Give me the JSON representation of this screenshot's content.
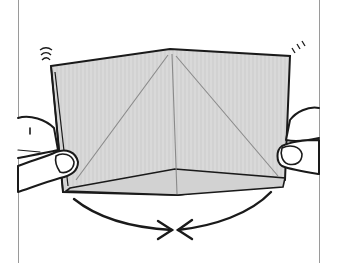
{
  "illustration": {
    "subject": "origami-fold-step",
    "colors": {
      "paper": "#d9d9d9",
      "paper_texture": "#c4c4c4",
      "outline": "#1a1a1a",
      "crease": "#8a8a8a",
      "frame": "#9a9a9a",
      "skin": "#ffffff"
    },
    "elements": [
      "paper",
      "left-hand",
      "right-hand",
      "motion-lines-left",
      "motion-lines-right",
      "arrows-converging"
    ]
  }
}
